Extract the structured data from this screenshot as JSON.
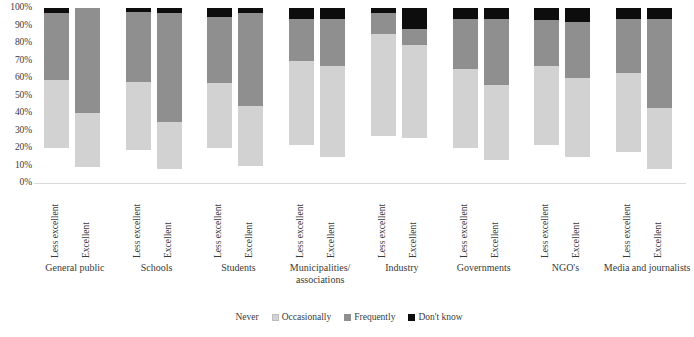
{
  "chart_data": {
    "type": "bar",
    "subtype": "stacked-100-percent",
    "title": "",
    "xlabel": "",
    "ylabel": "",
    "ylim": [
      0,
      100
    ],
    "ytick_labels": [
      "100%",
      "90%",
      "80%",
      "70%",
      "60%",
      "50%",
      "40%",
      "30%",
      "20%",
      "10%",
      "0%"
    ],
    "grid": false,
    "legend_position": "bottom",
    "bar_labels": [
      "Less excellent",
      "Excellent"
    ],
    "categories": [
      "General public",
      "Schools",
      "Students",
      "Municipalities/ associations",
      "Industry",
      "Governments",
      "NGO's",
      "Media and journalists"
    ],
    "series": [
      {
        "name": "Never",
        "color": "#ffffff",
        "values": [
          [
            20,
            9
          ],
          [
            19,
            8
          ],
          [
            20,
            10
          ],
          [
            22,
            15
          ],
          [
            27,
            26
          ],
          [
            20,
            13
          ],
          [
            22,
            15
          ],
          [
            18,
            8
          ]
        ]
      },
      {
        "name": "Occasionally",
        "color": "#d2d2d2",
        "values": [
          [
            39,
            31
          ],
          [
            39,
            27
          ],
          [
            37,
            34
          ],
          [
            48,
            52
          ],
          [
            58,
            53
          ],
          [
            45,
            43
          ],
          [
            45,
            45
          ],
          [
            45,
            35
          ]
        ]
      },
      {
        "name": "Frequently",
        "color": "#8f8f8f",
        "values": [
          [
            38,
            60
          ],
          [
            40,
            62
          ],
          [
            38,
            53
          ],
          [
            24,
            27
          ],
          [
            12,
            9
          ],
          [
            29,
            38
          ],
          [
            26,
            32
          ],
          [
            31,
            51
          ]
        ]
      },
      {
        "name": "Don't know",
        "color": "#0d0d0d",
        "values": [
          [
            3,
            0
          ],
          [
            2,
            3
          ],
          [
            5,
            3
          ],
          [
            6,
            6
          ],
          [
            3,
            12
          ],
          [
            6,
            6
          ],
          [
            7,
            8
          ],
          [
            6,
            6
          ]
        ]
      }
    ]
  },
  "legend": {
    "items": [
      {
        "label": "Never",
        "swatch": "never"
      },
      {
        "label": "Occasionally",
        "swatch": "occasionally"
      },
      {
        "label": "Frequently",
        "swatch": "frequently"
      },
      {
        "label": "Don't know",
        "swatch": "dontknow"
      }
    ]
  }
}
